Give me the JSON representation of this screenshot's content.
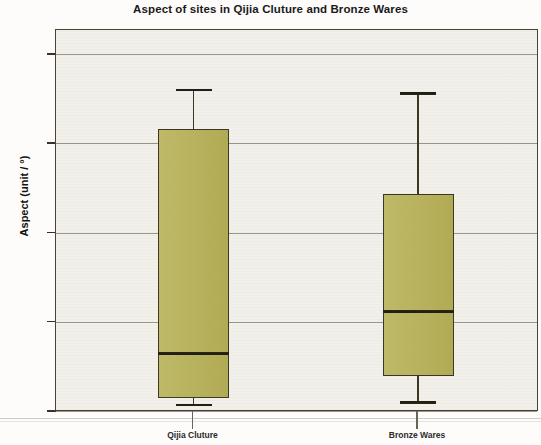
{
  "chart_data": {
    "type": "box",
    "title": "Aspect of sites in Qijia Cluture and Bronze Wares",
    "xlabel": "",
    "ylabel": "Aspect (unit / °)",
    "ylim": [
      -10,
      428
    ],
    "yticks": [
      0,
      100,
      200,
      300,
      400
    ],
    "ytick_labels": [
      "0",
      "100",
      "200",
      "300",
      "400"
    ],
    "grid": true,
    "grid_axis": "y",
    "legend": "none",
    "categories": [
      "Qijia Cluture",
      "Bronze Wares"
    ],
    "box_fill_color": "#b8b257",
    "box_line_color": "#3c3523",
    "plot_bg_color": "#f2f0ea",
    "boxes": [
      {
        "label": "Qijia Cluture",
        "whisker_low": 8,
        "q1": 15,
        "median": 65,
        "q3": 316,
        "whisker_high": 361,
        "outliers": []
      },
      {
        "label": "Bronze Wares",
        "whisker_low": 11,
        "q1": 39,
        "median": 112,
        "q3": 243,
        "whisker_high": 357,
        "outliers": []
      }
    ]
  }
}
